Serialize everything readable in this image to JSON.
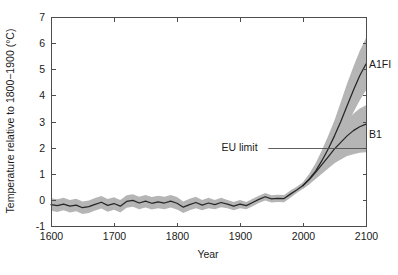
{
  "chart_data": {
    "type": "line",
    "title": "",
    "xlabel": "Year",
    "ylabel": "Temperature relative to 1800−1900 (°C)",
    "xlim": [
      1600,
      2100
    ],
    "ylim": [
      -1,
      7
    ],
    "xticks": [
      1600,
      1700,
      1800,
      1900,
      2000,
      2100
    ],
    "xticklabels": [
      "1600",
      "1700",
      "1800",
      "1900",
      "2000",
      "2100"
    ],
    "yticks": [
      -1,
      0,
      1,
      2,
      3,
      4,
      5,
      6,
      7
    ],
    "yticklabels": [
      "-1",
      "0",
      "1",
      "2",
      "3",
      "4",
      "5",
      "6",
      "7"
    ],
    "grid": false,
    "legend_position": "right-of-axis-inline",
    "band_color": "#b5b5b5",
    "line_color": "#262626",
    "axis_color": "#4d4d4d",
    "series": [
      {
        "name": "Reconstruction",
        "label": "",
        "x": [
          1600,
          1610,
          1620,
          1630,
          1640,
          1650,
          1660,
          1670,
          1680,
          1690,
          1700,
          1710,
          1720,
          1730,
          1740,
          1750,
          1760,
          1770,
          1780,
          1790,
          1800,
          1810,
          1820,
          1830,
          1840,
          1850,
          1860,
          1870,
          1880,
          1890,
          1900,
          1910,
          1920,
          1930,
          1940,
          1950,
          1960,
          1970,
          1980,
          1990,
          2000
        ],
        "values": [
          -0.18,
          -0.22,
          -0.16,
          -0.24,
          -0.2,
          -0.3,
          -0.26,
          -0.17,
          -0.09,
          -0.21,
          -0.14,
          -0.24,
          -0.06,
          -0.02,
          -0.12,
          -0.05,
          -0.13,
          -0.08,
          -0.12,
          -0.05,
          -0.13,
          -0.28,
          -0.18,
          -0.1,
          -0.2,
          -0.12,
          -0.18,
          -0.1,
          -0.16,
          -0.24,
          -0.16,
          -0.22,
          -0.1,
          0.02,
          0.12,
          0.04,
          0.06,
          0.05,
          0.22,
          0.38,
          0.55
        ],
        "band_lower": [
          -0.42,
          -0.46,
          -0.4,
          -0.48,
          -0.44,
          -0.54,
          -0.5,
          -0.41,
          -0.33,
          -0.45,
          -0.38,
          -0.48,
          -0.3,
          -0.26,
          -0.36,
          -0.29,
          -0.37,
          -0.32,
          -0.36,
          -0.29,
          -0.37,
          -0.5,
          -0.4,
          -0.32,
          -0.4,
          -0.32,
          -0.36,
          -0.28,
          -0.32,
          -0.4,
          -0.32,
          -0.36,
          -0.24,
          -0.12,
          -0.02,
          -0.1,
          -0.08,
          -0.09,
          0.08,
          0.26,
          0.43
        ],
        "band_upper": [
          0.06,
          0.02,
          0.08,
          0.0,
          0.04,
          -0.06,
          -0.02,
          0.07,
          0.15,
          0.03,
          0.1,
          0.0,
          0.18,
          0.22,
          0.12,
          0.19,
          0.11,
          0.16,
          0.12,
          0.19,
          0.11,
          -0.06,
          0.04,
          0.12,
          0.0,
          0.08,
          0.0,
          0.08,
          0.0,
          -0.08,
          0.0,
          -0.08,
          0.04,
          0.16,
          0.26,
          0.18,
          0.2,
          0.19,
          0.36,
          0.5,
          0.67
        ]
      },
      {
        "name": "A1FI",
        "label": "A1FI",
        "label_value": 5.2,
        "x": [
          2000,
          2010,
          2020,
          2030,
          2040,
          2050,
          2060,
          2070,
          2080,
          2090,
          2100
        ],
        "values": [
          0.55,
          0.8,
          1.1,
          1.5,
          1.95,
          2.45,
          3.0,
          3.6,
          4.2,
          4.75,
          5.2
        ],
        "band_lower": [
          0.43,
          0.6,
          0.85,
          1.15,
          1.5,
          1.9,
          2.35,
          2.85,
          3.35,
          3.8,
          4.2
        ],
        "band_upper": [
          0.67,
          1.0,
          1.4,
          1.9,
          2.45,
          3.05,
          3.75,
          4.45,
          5.1,
          5.7,
          6.2
        ]
      },
      {
        "name": "B1",
        "label": "B1",
        "label_value": 2.5,
        "x": [
          2000,
          2010,
          2020,
          2030,
          2040,
          2050,
          2060,
          2070,
          2080,
          2090,
          2100
        ],
        "values": [
          0.55,
          0.78,
          1.05,
          1.35,
          1.65,
          1.95,
          2.2,
          2.45,
          2.65,
          2.8,
          2.9
        ],
        "band_lower": [
          0.43,
          0.6,
          0.8,
          1.0,
          1.2,
          1.4,
          1.55,
          1.68,
          1.75,
          1.8,
          1.82
        ],
        "band_upper": [
          0.67,
          0.95,
          1.3,
          1.68,
          2.05,
          2.42,
          2.75,
          3.05,
          3.3,
          3.5,
          3.62
        ]
      }
    ],
    "annotations": [
      {
        "name": "eu-limit",
        "text": "EU limit",
        "value": 2.0,
        "text_x": 1928,
        "leader_x_start": 1945,
        "leader_x_end": 2100
      }
    ]
  }
}
